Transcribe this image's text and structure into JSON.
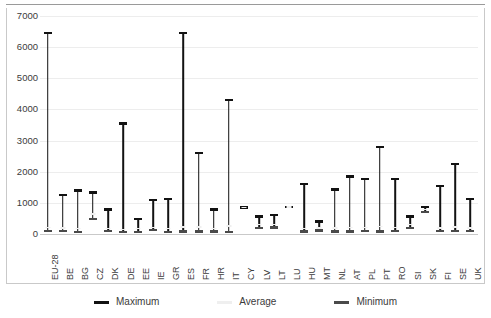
{
  "chart_data": {
    "type": "bar",
    "chart_style": "high-low-close range chart",
    "title": "",
    "subtitle": "",
    "xlabel": "",
    "ylabel": "",
    "ylim": [
      0,
      7000
    ],
    "ytick_values": [
      0,
      1000,
      2000,
      3000,
      4000,
      5000,
      6000,
      7000
    ],
    "ytick_labels": [
      "0",
      "1000",
      "2000",
      "3000",
      "4000",
      "5000",
      "6000",
      "7000"
    ],
    "grid": true,
    "legend_position": "bottom",
    "categories": [
      "EU-28",
      "BE",
      "BG",
      "CZ",
      "DK",
      "DE",
      "EE",
      "IE",
      "GR",
      "ES",
      "FR",
      "HR",
      "IT",
      "CY",
      "LV",
      "LT",
      "LU",
      "HU",
      "MT",
      "NL",
      "AT",
      "PL",
      "PT",
      "RO",
      "SI",
      "SK",
      "FI",
      "SE",
      "UK"
    ],
    "series": [
      {
        "name": "Maximum",
        "color": "#121212",
        "values": [
          6450,
          1250,
          1400,
          1330,
          790,
          3550,
          480,
          1100,
          1130,
          6450,
          2600,
          790,
          4300,
          850,
          560,
          610,
          860,
          1600,
          400,
          1430,
          1850,
          1760,
          2800,
          1770,
          560,
          870,
          1540,
          2250,
          1120
        ]
      },
      {
        "name": "Average",
        "color": "#efefef",
        "values": [
          210,
          200,
          175,
          640,
          180,
          150,
          170,
          215,
          180,
          220,
          230,
          180,
          260,
          850,
          300,
          310,
          860,
          180,
          190,
          185,
          210,
          215,
          240,
          215,
          300,
          790,
          200,
          230,
          190
        ]
      },
      {
        "name": "Minimum",
        "color": "#4a4a4a",
        "values": [
          90,
          95,
          70,
          480,
          90,
          55,
          70,
          120,
          60,
          80,
          75,
          75,
          70,
          850,
          200,
          210,
          860,
          80,
          110,
          80,
          85,
          90,
          85,
          95,
          200,
          700,
          95,
          95,
          90
        ]
      }
    ]
  },
  "legend": {
    "items": [
      {
        "label": "Maximum",
        "color": "#121212"
      },
      {
        "label": "Average",
        "color": "#efefef"
      },
      {
        "label": "Minimum",
        "color": "#4a4a4a"
      }
    ]
  }
}
